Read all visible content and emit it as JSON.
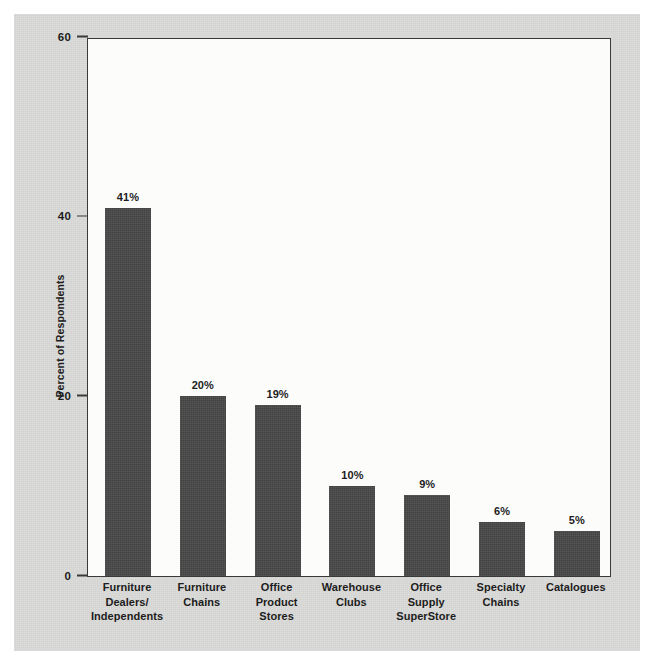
{
  "figure": {
    "background_color": "#d8d8d6",
    "plot_background_color": "#fcfcfb",
    "bar_color": "#484848",
    "axis_color": "#3a3a3a",
    "text_color": "#1d1d1d"
  },
  "chart_data": {
    "type": "bar",
    "title": "",
    "xlabel": "",
    "ylabel": "Percent of Respondents",
    "ylim": [
      0,
      60
    ],
    "yticks": [
      0,
      20,
      40,
      60
    ],
    "ytick_labels": [
      "0",
      "20",
      "40",
      "60"
    ],
    "grid": false,
    "legend": null,
    "categories": [
      "Furniture Dealers/ Independents",
      "Furniture Chains",
      "Office Product Stores",
      "Warehouse Clubs",
      "Office Supply SuperStore",
      "Specialty Chains",
      "Catalogues"
    ],
    "category_lines": [
      [
        "Furniture",
        "Dealers/",
        "Independents"
      ],
      [
        "Furniture",
        "Chains"
      ],
      [
        "Office",
        "Product",
        "Stores"
      ],
      [
        "Warehouse",
        "Clubs"
      ],
      [
        "Office",
        "Supply",
        "SuperStore"
      ],
      [
        "Specialty",
        "Chains"
      ],
      [
        "Catalogues"
      ]
    ],
    "values": [
      41,
      20,
      19,
      10,
      9,
      6,
      5
    ],
    "value_labels": [
      "41%",
      "20%",
      "19%",
      "10%",
      "9%",
      "6%",
      "5%"
    ]
  }
}
